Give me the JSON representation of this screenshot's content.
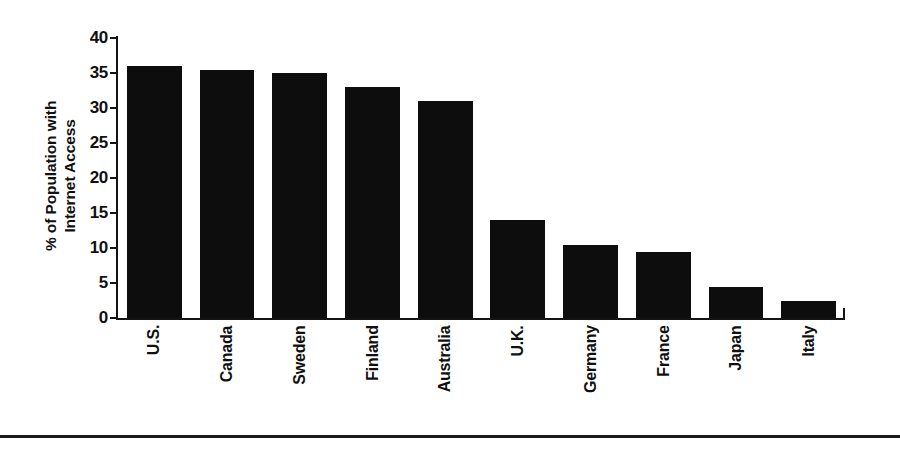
{
  "chart_data": {
    "type": "bar",
    "title": "",
    "xlabel": "",
    "ylabel": "% of Population with Internet Access",
    "ylabel_lines": [
      "% of Population with",
      "Internet Access"
    ],
    "categories": [
      "U.S.",
      "Canada",
      "Sweden",
      "Finland",
      "Australia",
      "U.K.",
      "Germany",
      "France",
      "Japan",
      "Italy"
    ],
    "values": [
      36,
      35.5,
      35,
      33,
      31,
      14,
      10.4,
      9.4,
      4.4,
      2.5
    ],
    "ylim": [
      0,
      40
    ],
    "yticks": [
      0,
      5,
      10,
      15,
      20,
      25,
      30,
      35,
      40
    ],
    "ytick_labels": [
      "0",
      "5",
      "10",
      "15",
      "20",
      "25",
      "30",
      "35",
      "40"
    ],
    "grid": false,
    "legend": false,
    "bar_color": "#0d0d0d",
    "background_color": "#ffffff",
    "axis_color": "#141414"
  },
  "figure": {
    "footer_rule": true
  }
}
